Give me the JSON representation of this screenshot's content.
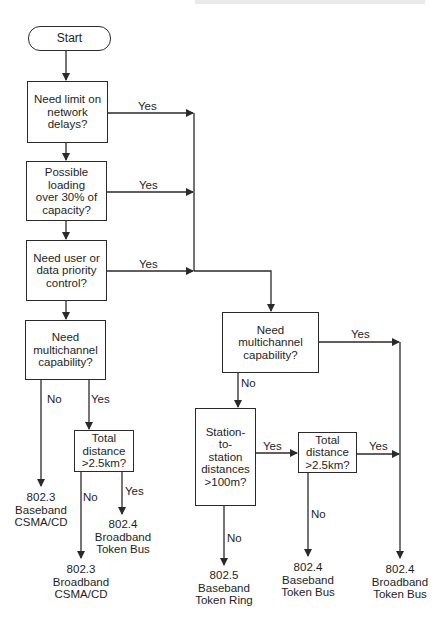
{
  "diagram": {
    "type": "flowchart",
    "start": {
      "label": "Start"
    },
    "decisions": [
      {
        "id": "d1",
        "label": "Need limit on\nnetwork\ndelays?",
        "yes": "right_branch"
      },
      {
        "id": "d2",
        "label": "Possible loading\nover 30% of\ncapacity?",
        "yes": "right_branch"
      },
      {
        "id": "d3",
        "label": "Need user or\ndata priority\ncontrol?",
        "yes": "right_branch"
      },
      {
        "id": "d4",
        "label": "Need\nmultichannel\ncapability?",
        "no": "o1",
        "yes": "d5"
      },
      {
        "id": "d5",
        "label": "Total\ndistance\n>2.5km?",
        "no": "o2",
        "yes": "o3"
      },
      {
        "id": "d6",
        "label": "Need\nmultichannel\ncapability?",
        "no": "d7",
        "yes": "o6"
      },
      {
        "id": "d7",
        "label": "Station-\nto-\nstation\ndistances\n>100m?",
        "no": "o4",
        "yes": "d8"
      },
      {
        "id": "d8",
        "label": "Total\ndistance\n>2.5km?",
        "no": "o5",
        "yes": "o6"
      }
    ],
    "outcomes": [
      {
        "id": "o1",
        "label": "802.3\nBaseband\nCSMA/CD"
      },
      {
        "id": "o2",
        "label": "802.3\nBroadband\nCSMA/CD"
      },
      {
        "id": "o3",
        "label": "802.4\nBroadband\nToken Bus"
      },
      {
        "id": "o4",
        "label": "802.5\nBaseband\nToken Ring"
      },
      {
        "id": "o5",
        "label": "802.4\nBaseband\nToken Bus"
      },
      {
        "id": "o6",
        "label": "802.4\nBroadband\nToken Bus"
      }
    ],
    "edge_labels": {
      "yes": "Yes",
      "no": "No"
    },
    "colors": {
      "line": "#2a2a2a",
      "text": "#1e1e1e",
      "background": "#ffffff"
    }
  }
}
